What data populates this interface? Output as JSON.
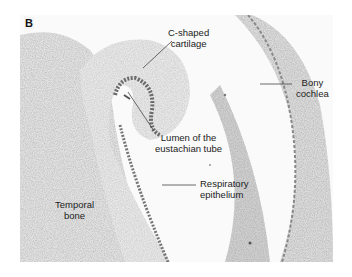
{
  "figure": {
    "panel_label": "B",
    "labels": {
      "c_shaped_cartilage": {
        "line1": "C-shaped",
        "line2": "cartilage"
      },
      "bony_cochlea": {
        "line1": "Bony",
        "line2": "cochlea"
      },
      "lumen": {
        "line1": "Lumen of the",
        "line2": "eustachian tube"
      },
      "respiratory_epithelium": {
        "line1": "Respiratory",
        "line2": "epithelium"
      },
      "temporal_bone": {
        "line1": "Temporal",
        "line2": "bone"
      }
    },
    "colors": {
      "background": "#ffffff",
      "tissue_light": "#e6e6e6",
      "tissue_mid": "#c8c8c8",
      "tissue_dark": "#8a8a8a",
      "text": "#222222",
      "leader_line": "#444444"
    }
  }
}
